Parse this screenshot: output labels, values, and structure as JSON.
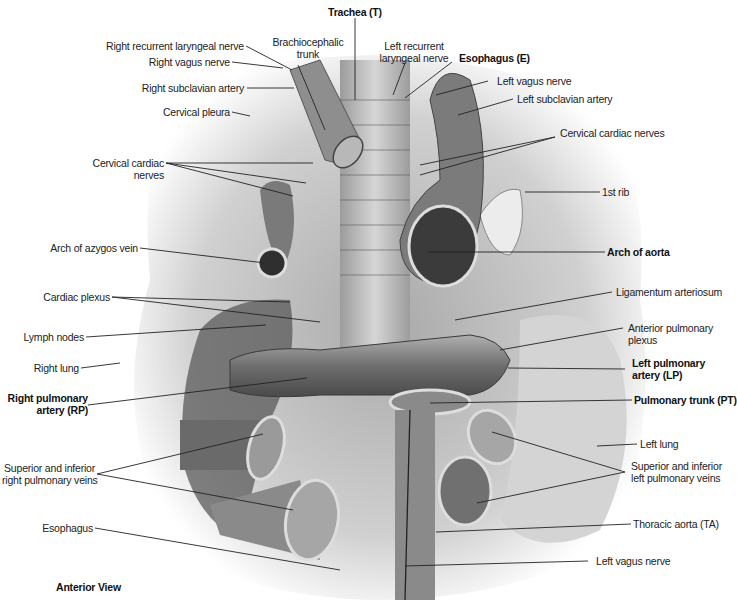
{
  "figure": {
    "view_label": "Anterior View",
    "colors": {
      "background": "#ffffff",
      "illustration_gray": "#8a8a8a",
      "label_text": "#222222",
      "leader_line": "#222222"
    },
    "labels": {
      "trachea": "Trachea (T)",
      "brachiocephalic_trunk_1": "Brachiocephalic",
      "brachiocephalic_trunk_2": "trunk",
      "left_recurrent_laryngeal_1": "Left recurrent",
      "left_recurrent_laryngeal_2": "laryngeal nerve",
      "esophagus_e": "Esophagus (E)",
      "left_vagus_nerve_top": "Left vagus nerve",
      "left_subclavian_artery": "Left subclavian artery",
      "cervical_cardiac_nerves_right": "Cervical cardiac nerves",
      "first_rib": "1st rib",
      "arch_of_aorta": "Arch of aorta",
      "ligamentum_arteriosum": "Ligamentum arteriosum",
      "anterior_pulmonary_plexus_1": "Anterior pulmonary",
      "anterior_pulmonary_plexus_2": "plexus",
      "left_pulmonary_artery_1": "Left pulmonary",
      "left_pulmonary_artery_2": "artery (LP)",
      "pulmonary_trunk": "Pulmonary trunk (PT)",
      "left_lung": "Left lung",
      "left_pulmonary_veins_1": "Superior and inferior",
      "left_pulmonary_veins_2": "left pulmonary veins",
      "thoracic_aorta": "Thoracic aorta (TA)",
      "left_vagus_nerve_bottom": "Left vagus nerve",
      "right_recurrent_laryngeal": "Right recurrent laryngeal nerve",
      "right_vagus_nerve": "Right vagus nerve",
      "right_subclavian_artery": "Right subclavian artery",
      "cervical_pleura": "Cervical pleura",
      "cervical_cardiac_nerves_left_1": "Cervical cardiac",
      "cervical_cardiac_nerves_left_2": "nerves",
      "arch_of_azygos_vein": "Arch of azygos vein",
      "cardiac_plexus": "Cardiac plexus",
      "lymph_nodes": "Lymph nodes",
      "right_lung": "Right lung",
      "right_pulmonary_artery_1": "Right pulmonary",
      "right_pulmonary_artery_2": "artery (RP)",
      "right_pulmonary_veins_1": "Superior and inferior",
      "right_pulmonary_veins_2": "right pulmonary veins",
      "esophagus": "Esophagus"
    }
  }
}
